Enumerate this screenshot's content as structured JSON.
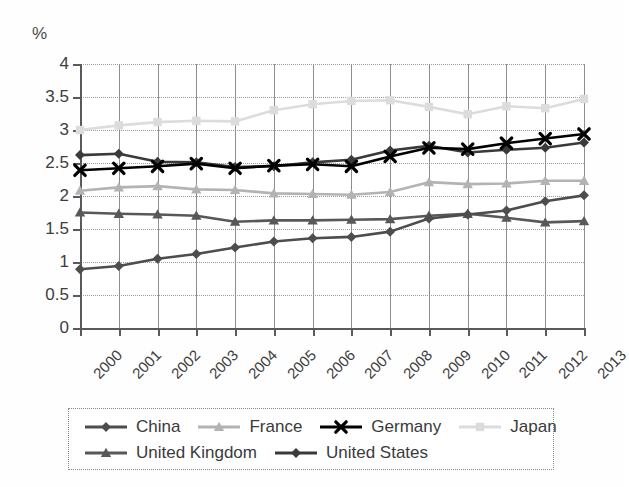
{
  "chart_data": {
    "type": "line",
    "title": "",
    "xlabel": "",
    "ylabel": "%",
    "unit_label": "%",
    "categories": [
      "2000",
      "2001",
      "2002",
      "2003",
      "2004",
      "2005",
      "2006",
      "2007",
      "2008",
      "2009",
      "2010",
      "2011",
      "2012",
      "2013"
    ],
    "x": [
      2000,
      2001,
      2002,
      2003,
      2004,
      2005,
      2006,
      2007,
      2008,
      2009,
      2010,
      2011,
      2012,
      2013
    ],
    "ylim": [
      0,
      4
    ],
    "ytick_labels": [
      "0",
      "0.5",
      "1",
      "1.5",
      "2",
      "2.5",
      "3",
      "3.5",
      "4"
    ],
    "ytick_values": [
      0,
      0.5,
      1,
      1.5,
      2,
      2.5,
      3,
      3.5,
      4
    ],
    "grid": true,
    "legend_position": "bottom",
    "series": [
      {
        "name": "China",
        "marker": "diamond",
        "color": "#4d4d4d",
        "values": [
          0.89,
          0.94,
          1.05,
          1.12,
          1.22,
          1.31,
          1.36,
          1.38,
          1.46,
          1.66,
          1.72,
          1.78,
          1.92,
          2.01
        ]
      },
      {
        "name": "France",
        "marker": "triangle",
        "color": "#b3b3b3",
        "values": [
          2.08,
          2.13,
          2.15,
          2.1,
          2.09,
          2.04,
          2.03,
          2.02,
          2.06,
          2.21,
          2.18,
          2.19,
          2.23,
          2.23
        ]
      },
      {
        "name": "Germany",
        "marker": "x",
        "color": "#000000",
        "values": [
          2.39,
          2.42,
          2.45,
          2.49,
          2.42,
          2.46,
          2.48,
          2.45,
          2.6,
          2.73,
          2.71,
          2.8,
          2.87,
          2.94
        ]
      },
      {
        "name": "Japan",
        "marker": "square",
        "color": "#dcdcdc",
        "values": [
          3.0,
          3.07,
          3.12,
          3.14,
          3.13,
          3.3,
          3.39,
          3.44,
          3.45,
          3.35,
          3.24,
          3.36,
          3.33,
          3.47
        ]
      },
      {
        "name": "United Kingdom",
        "marker": "triangle",
        "color": "#585858",
        "values": [
          1.75,
          1.73,
          1.72,
          1.7,
          1.61,
          1.63,
          1.63,
          1.64,
          1.65,
          1.7,
          1.73,
          1.67,
          1.6,
          1.62
        ]
      },
      {
        "name": "United States",
        "marker": "diamond",
        "color": "#3a3a3a",
        "values": [
          2.62,
          2.64,
          2.52,
          2.51,
          2.44,
          2.45,
          2.51,
          2.55,
          2.69,
          2.76,
          2.66,
          2.7,
          2.73,
          2.81
        ]
      }
    ]
  },
  "legend": {
    "rows": [
      [
        {
          "label": "China",
          "series": 0
        },
        {
          "label": "France",
          "series": 1
        },
        {
          "label": "Germany",
          "series": 2
        },
        {
          "label": "Japan",
          "series": 3
        }
      ],
      [
        {
          "label": "United Kingdom",
          "series": 4
        },
        {
          "label": "United States",
          "series": 5
        }
      ]
    ]
  }
}
